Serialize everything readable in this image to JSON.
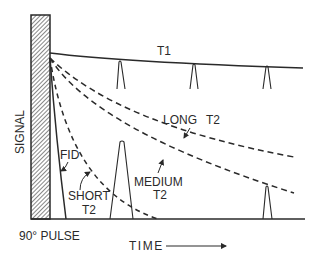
{
  "diagram": {
    "type": "nmr-spin-echo-relaxation",
    "y_axis_label": "SIGNAL",
    "x_axis_label": "TIME",
    "pulse_label": "90° PULSE",
    "curves": {
      "t1": {
        "label": "T1",
        "style": "solid"
      },
      "long_t2": {
        "label_line1": "LONG",
        "label_line2": "T2",
        "style": "dashed"
      },
      "medium_t2": {
        "label_line1": "MEDIUM",
        "label_line2": "T2",
        "style": "dashed"
      },
      "short_t2": {
        "label_line1": "SHORT",
        "label_line2": "T2",
        "style": "dashed"
      },
      "fid": {
        "label": "FID",
        "style": "solid"
      }
    },
    "colors": {
      "ink": "#2a2a2a",
      "background": "#ffffff",
      "pulse_fill": "#9a9a9a"
    }
  }
}
